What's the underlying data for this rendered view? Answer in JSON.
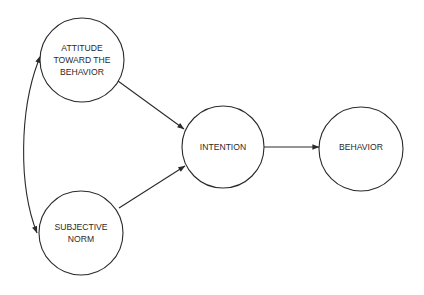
{
  "diagram": {
    "type": "path-model",
    "nodes": [
      {
        "id": "attitude",
        "lines": [
          "ATTITUDE",
          "TOWARD THE",
          "BEHAVIOR"
        ],
        "cx": 82,
        "cy": 60,
        "r": 42
      },
      {
        "id": "norm",
        "lines": [
          "SUBJECTIVE",
          "NORM"
        ],
        "cx": 81,
        "cy": 233,
        "r": 42
      },
      {
        "id": "intention",
        "lines": [
          "INTENTION"
        ],
        "cx": 223,
        "cy": 147,
        "r": 41
      },
      {
        "id": "behavior",
        "lines": [
          "BEHAVIOR"
        ],
        "cx": 361,
        "cy": 149,
        "r": 42
      }
    ],
    "edges": [
      {
        "from": "attitude",
        "to": "intention",
        "style": "directed"
      },
      {
        "from": "norm",
        "to": "intention",
        "style": "directed"
      },
      {
        "from": "intention",
        "to": "behavior",
        "style": "directed"
      },
      {
        "from": "attitude",
        "to": "norm",
        "style": "bidirectional-curved"
      }
    ],
    "colors": {
      "stroke": "#2a2a2a",
      "background": "#ffffff"
    }
  },
  "labels": {
    "attitude": {
      "l1": "ATTITUDE",
      "l2": "TOWARD THE",
      "l3": "BEHAVIOR"
    },
    "norm": {
      "l1": "SUBJECTIVE",
      "l2": "NORM"
    },
    "intention": {
      "l1": "INTENTION"
    },
    "behavior": {
      "l1": "BEHAVIOR"
    }
  }
}
